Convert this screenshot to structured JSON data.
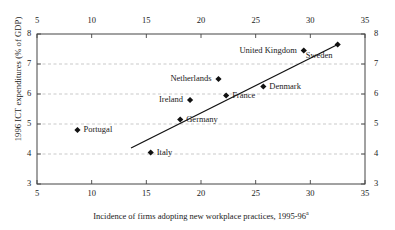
{
  "chart_data": {
    "type": "scatter",
    "title": "",
    "xlabel": "Incidence of firms adopting new workplace practices, 1995-96",
    "xlabel_superscript": "a",
    "ylabel": "1996 ICT expenditures (% of GDP)",
    "xlim": [
      5,
      35
    ],
    "ylim": [
      3,
      8
    ],
    "xticks": [
      "5",
      "10",
      "15",
      "20",
      "25",
      "30",
      "35"
    ],
    "yticks": [
      "8",
      "7",
      "6",
      "5",
      "4",
      "3"
    ],
    "grid": "horizontal-dashed",
    "axes": "box with ticks on all four sides; tick labels on top, bottom, left and right",
    "legend": "none",
    "points": [
      {
        "label": "Portugal",
        "x": 8.7,
        "y": 4.8,
        "label_pos": "right"
      },
      {
        "label": "Italy",
        "x": 15.4,
        "y": 4.05,
        "label_pos": "right"
      },
      {
        "label": "Germany",
        "x": 18.1,
        "y": 5.15,
        "label_pos": "right"
      },
      {
        "label": "Ireland",
        "x": 19.0,
        "y": 5.8,
        "label_pos": "left"
      },
      {
        "label": "Netherlands",
        "x": 21.6,
        "y": 6.5,
        "label_pos": "left"
      },
      {
        "label": "France",
        "x": 22.3,
        "y": 5.95,
        "label_pos": "right"
      },
      {
        "label": "Denmark",
        "x": 25.7,
        "y": 6.25,
        "label_pos": "right"
      },
      {
        "label": "United Kingdom",
        "x": 29.4,
        "y": 7.45,
        "label_pos": "left"
      },
      {
        "label": "Sweden",
        "x": 32.5,
        "y": 7.65,
        "label_pos": "below-left"
      }
    ],
    "trendline": {
      "description": "linear fit through the points",
      "x_start": 13.6,
      "y_start": 4.2,
      "x_end": 32.5,
      "y_end": 7.65
    }
  },
  "colors": {
    "axis": "#444444",
    "grid": "#bbbbbb",
    "marker": "#111111",
    "trendline": "#111111",
    "background": "#ffffff",
    "text": "#1a1a1a"
  }
}
